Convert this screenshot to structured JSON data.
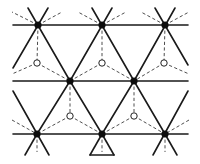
{
  "diagram": {
    "type": "triangular-lattice",
    "colors": {
      "bond": "#1a1a1a",
      "dash": "#3a3a3a",
      "filled_site": "#0d0d0d",
      "open_site_fill": "#ffffff",
      "background": "#ffffff"
    },
    "filled_sites": [
      {
        "x": 38,
        "y": 25
      },
      {
        "x": 102,
        "y": 25
      },
      {
        "x": 165,
        "y": 25
      },
      {
        "x": 70,
        "y": 81
      },
      {
        "x": 134,
        "y": 81
      },
      {
        "x": 37,
        "y": 134
      },
      {
        "x": 102,
        "y": 134
      },
      {
        "x": 165,
        "y": 134
      }
    ],
    "open_sites": [
      {
        "x": 37,
        "y": 63
      },
      {
        "x": 102,
        "y": 63
      },
      {
        "x": 164,
        "y": 63
      },
      {
        "x": 70,
        "y": 116
      },
      {
        "x": 134,
        "y": 116
      }
    ],
    "solid_lines": [
      [
        13,
        25,
        188,
        25
      ],
      [
        13,
        81,
        188,
        81
      ],
      [
        13,
        134,
        188,
        134
      ],
      [
        28,
        8,
        70,
        81
      ],
      [
        48,
        8,
        13,
        68
      ],
      [
        92,
        8,
        134,
        81
      ],
      [
        112,
        8,
        70,
        81
      ],
      [
        155,
        8,
        188,
        65
      ],
      [
        175,
        8,
        134,
        81
      ],
      [
        70,
        81,
        37,
        134
      ],
      [
        70,
        81,
        102,
        134
      ],
      [
        134,
        81,
        102,
        134
      ],
      [
        134,
        81,
        165,
        134
      ],
      [
        13,
        91,
        49,
        155
      ],
      [
        188,
        91,
        153,
        155
      ],
      [
        25,
        155,
        37,
        134
      ],
      [
        90,
        155,
        114,
        155
      ],
      [
        177,
        155,
        165,
        134
      ],
      [
        114,
        155,
        102,
        134
      ],
      [
        90,
        155,
        102,
        134
      ]
    ],
    "dashed_lines": [
      [
        38,
        25,
        37,
        63
      ],
      [
        102,
        25,
        102,
        63
      ],
      [
        165,
        25,
        164,
        63
      ],
      [
        37,
        63,
        70,
        81
      ],
      [
        37,
        63,
        12,
        74
      ],
      [
        102,
        63,
        70,
        81
      ],
      [
        102,
        63,
        134,
        81
      ],
      [
        164,
        63,
        134,
        81
      ],
      [
        164,
        63,
        189,
        74
      ],
      [
        70,
        81,
        70,
        116
      ],
      [
        134,
        81,
        134,
        116
      ],
      [
        70,
        116,
        37,
        134
      ],
      [
        70,
        116,
        102,
        134
      ],
      [
        134,
        116,
        102,
        134
      ],
      [
        134,
        116,
        165,
        134
      ],
      [
        12,
        120,
        37,
        134
      ],
      [
        189,
        120,
        165,
        134
      ],
      [
        38,
        25,
        12,
        12
      ],
      [
        38,
        25,
        62,
        12
      ],
      [
        102,
        25,
        78,
        12
      ],
      [
        102,
        25,
        126,
        12
      ],
      [
        165,
        25,
        141,
        12
      ],
      [
        165,
        25,
        189,
        12
      ],
      [
        37,
        134,
        37,
        152
      ],
      [
        102,
        134,
        102,
        152
      ],
      [
        165,
        134,
        165,
        152
      ]
    ]
  }
}
